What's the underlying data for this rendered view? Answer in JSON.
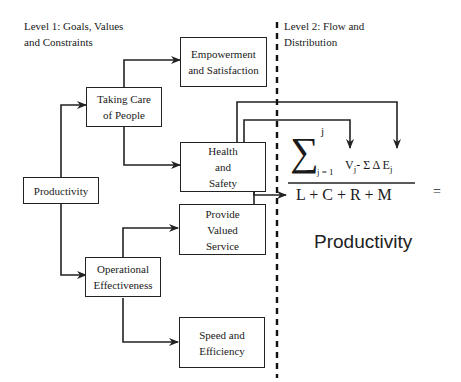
{
  "level1_label": "Level 1:  Goals, Values\nand Constraints",
  "level2_label": "Level 2:  Flow and\nDistribution",
  "boxes": {
    "productivity": "Productivity",
    "taking_care": "Taking Care\nof People",
    "operational": "Operational\nEffectiveness",
    "empowerment": "Empowerment\nand Satisfaction",
    "health": "Health\nand\nSafety",
    "valued_service": "Provide\nValued\nService",
    "speed": "Speed and\nEfficiency"
  },
  "formula": {
    "sigma": "∑",
    "upper": "j",
    "lower": "j = 1",
    "numerator": "V",
    "numerator_sub": "j",
    "minus_sum": "- Σ  Δ E",
    "e_sub": "j",
    "denominator": "L +  C + R + M",
    "equals": "="
  },
  "result_label": "Productivity"
}
